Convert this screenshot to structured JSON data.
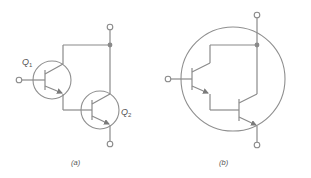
{
  "figure": {
    "panels": [
      {
        "id": "a",
        "caption": "(a)",
        "description": "Two discrete NPN transistors connected as a Darlington pair",
        "transistors": [
          {
            "label": "Q",
            "subscript": "1"
          },
          {
            "label": "Q",
            "subscript": "2"
          }
        ]
      },
      {
        "id": "b",
        "caption": "(b)",
        "description": "Darlington pair drawn inside a single transistor envelope"
      }
    ],
    "colors": {
      "line": "#8a8a8a",
      "text": "#555555",
      "background": "#ffffff"
    }
  }
}
